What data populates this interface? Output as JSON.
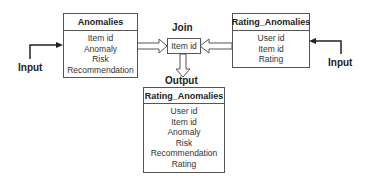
{
  "entities": {
    "anomalies": {
      "title": "Anomalies",
      "fields": [
        "Item id",
        "Anomaly",
        "Risk",
        "Recommendation"
      ]
    },
    "rating_anomalies": {
      "title": "Rating_Anomalies",
      "fields": [
        "User id",
        "Item id",
        "Rating"
      ]
    },
    "output": {
      "title": "Rating_Anomalies",
      "fields": [
        "User id",
        "Item id",
        "Anomaly",
        "Risk",
        "Recommendation",
        "Rating"
      ]
    }
  },
  "join": {
    "label": "Join",
    "key": "Item id"
  },
  "labels": {
    "input_left": "Input",
    "input_right": "Input",
    "output": "Output"
  },
  "colors": {
    "stroke": "#555555",
    "text": "#222222",
    "background": "#ffffff"
  }
}
